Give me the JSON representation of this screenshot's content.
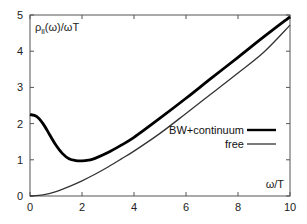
{
  "chart_data": {
    "type": "line",
    "title": "",
    "xlabel": "ω/T",
    "ylabel": "ρ_ll(ω)/ωT",
    "ylabel_main": "ρ",
    "ylabel_sub": "ll",
    "ylabel_rest": "(ω)/ωT",
    "xlim": [
      0,
      10
    ],
    "ylim": [
      0,
      5
    ],
    "xticks": [
      0,
      2,
      4,
      6,
      8,
      10
    ],
    "yticks": [
      0,
      1,
      2,
      3,
      4,
      5
    ],
    "xtick_labels": [
      "0",
      "2",
      "4",
      "6",
      "8",
      "10"
    ],
    "ytick_labels": [
      "0",
      "1",
      "2",
      "3",
      "4",
      "5"
    ],
    "grid": false,
    "legend_position": "center-right",
    "series": [
      {
        "name": "BW+continuum",
        "style": "thick",
        "color": "#000000",
        "x": [
          0,
          0.25,
          0.5,
          0.75,
          1.0,
          1.25,
          1.5,
          1.75,
          2.0,
          2.25,
          2.5,
          3.0,
          3.5,
          4.0,
          5.0,
          6.0,
          7.0,
          8.0,
          9.0,
          10.0
        ],
        "y": [
          2.25,
          2.2,
          2.0,
          1.7,
          1.4,
          1.17,
          1.03,
          0.98,
          0.97,
          0.99,
          1.04,
          1.2,
          1.4,
          1.62,
          2.15,
          2.7,
          3.27,
          3.83,
          4.4,
          4.95
        ]
      },
      {
        "name": "free",
        "style": "thin",
        "color": "#333333",
        "x": [
          0,
          0.5,
          1.0,
          1.5,
          2.0,
          2.5,
          3.0,
          3.5,
          4.0,
          5.0,
          6.0,
          7.0,
          8.0,
          9.0,
          10.0
        ],
        "y": [
          0.0,
          0.03,
          0.12,
          0.26,
          0.42,
          0.6,
          0.8,
          1.02,
          1.24,
          1.73,
          2.28,
          2.84,
          3.4,
          3.98,
          4.72
        ]
      }
    ]
  }
}
